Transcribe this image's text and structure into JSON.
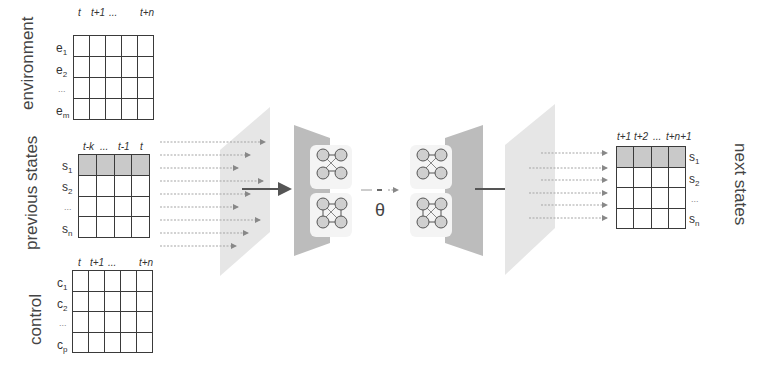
{
  "diagram": {
    "inputs": {
      "environment": {
        "label": "environment",
        "columns": [
          "t",
          "t+1",
          "...",
          "",
          "t+n"
        ],
        "rows": [
          {
            "base": "e",
            "sub": "1"
          },
          {
            "base": "e",
            "sub": "2"
          },
          {
            "base": "...",
            "sub": ""
          },
          {
            "base": "e",
            "sub": "m"
          }
        ]
      },
      "previous_states": {
        "label": "previous states",
        "columns": [
          "t-k",
          "...",
          "t-1",
          "t"
        ],
        "rows": [
          {
            "base": "s",
            "sub": "1"
          },
          {
            "base": "s",
            "sub": "2"
          },
          {
            "base": "...",
            "sub": ""
          },
          {
            "base": "s",
            "sub": "n"
          }
        ],
        "shaded_row": 0
      },
      "control": {
        "label": "control",
        "columns": [
          "t",
          "t+1",
          "...",
          "",
          "t+n"
        ],
        "rows": [
          {
            "base": "c",
            "sub": "1"
          },
          {
            "base": "c",
            "sub": "2"
          },
          {
            "base": "...",
            "sub": ""
          },
          {
            "base": "c",
            "sub": "p"
          }
        ]
      }
    },
    "model": {
      "parameter_symbol": "θ",
      "encoder_blocks": 2,
      "decoder_blocks": 2,
      "connector": "..."
    },
    "output": {
      "label": "next states",
      "columns": [
        "t+1",
        "t+2",
        "...",
        "t+n+1"
      ],
      "rows": [
        {
          "base": "s",
          "sub": "1"
        },
        {
          "base": "s",
          "sub": "2"
        },
        {
          "base": "...",
          "sub": ""
        },
        {
          "base": "s",
          "sub": "n"
        }
      ],
      "shaded_row": 0
    },
    "colors": {
      "grid_line": "#3a3a3a",
      "shaded_cell": "#c9c9c9",
      "input_plane": "#e4e4e4",
      "encoder_plane": "#bdbdbd",
      "node_fill": "#cfcfcf",
      "node_stroke": "#555555",
      "arrow": "#666666",
      "dashed_arrow": "#9a9a9a"
    }
  }
}
